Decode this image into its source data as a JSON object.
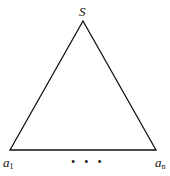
{
  "diagram": {
    "type": "triangle",
    "apex_label": "S",
    "bottom_left_label": {
      "base": "a",
      "sub": "1"
    },
    "bottom_right_label": {
      "base": "a",
      "sub": "n"
    },
    "ellipsis": "• • •",
    "stroke_color": "#111111",
    "background": "#ffffff"
  }
}
